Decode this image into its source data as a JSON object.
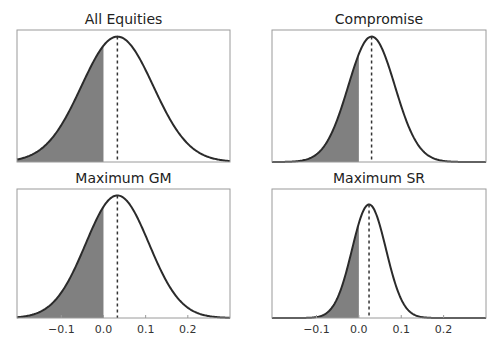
{
  "figure": {
    "width": 501,
    "height": 346,
    "colors": {
      "curve": "#2b2b2b",
      "fill": "#808080",
      "frame": "#9a9a9a",
      "mean_line": "#333333",
      "text": "#222222"
    }
  },
  "panels": [
    {
      "title": "All Equities",
      "show_xticks": false
    },
    {
      "title": "Compromise",
      "show_xticks": false
    },
    {
      "title": "Maximum GM",
      "show_xticks": true
    },
    {
      "title": "Maximum SR",
      "show_xticks": true
    }
  ],
  "chart_data": [
    {
      "type": "area",
      "title": "All Equities",
      "distribution": "normal",
      "mean": 0.033,
      "std": 0.085,
      "shaded_region": {
        "from": "xmin",
        "to": 0.0
      },
      "mean_line": {
        "x": 0.033,
        "style": "dashed"
      },
      "xlim": [
        -0.205,
        0.3
      ],
      "xticks": [],
      "xtick_labels": [],
      "yticks": [],
      "peak_fraction_of_axis": 0.95
    },
    {
      "type": "area",
      "title": "Compromise",
      "distribution": "normal",
      "mean": 0.03,
      "std": 0.055,
      "shaded_region": {
        "from": "xmin",
        "to": 0.0
      },
      "mean_line": {
        "x": 0.03,
        "style": "dashed"
      },
      "xlim": [
        -0.205,
        0.3
      ],
      "xticks": [],
      "xtick_labels": [],
      "yticks": [],
      "peak_fraction_of_axis": 0.95
    },
    {
      "type": "area",
      "title": "Maximum GM",
      "distribution": "normal",
      "mean": 0.033,
      "std": 0.075,
      "shaded_region": {
        "from": "xmin",
        "to": 0.0
      },
      "mean_line": {
        "x": 0.033,
        "style": "dashed"
      },
      "xlim": [
        -0.205,
        0.3
      ],
      "xticks": [
        -0.1,
        0.0,
        0.1,
        0.2
      ],
      "xtick_labels": [
        "−0.1",
        "0.0",
        "0.1",
        "0.2"
      ],
      "yticks": [],
      "peak_fraction_of_axis": 0.95
    },
    {
      "type": "area",
      "title": "Maximum SR",
      "distribution": "normal",
      "mean": 0.024,
      "std": 0.04,
      "shaded_region": {
        "from": "xmin",
        "to": 0.0
      },
      "mean_line": {
        "x": 0.024,
        "style": "dashed"
      },
      "xlim": [
        -0.205,
        0.3
      ],
      "xticks": [
        -0.1,
        0.0,
        0.1,
        0.2
      ],
      "xtick_labels": [
        "−0.1",
        "0.0",
        "0.1",
        "0.2"
      ],
      "yticks": [],
      "peak_fraction_of_axis": 0.88
    }
  ]
}
